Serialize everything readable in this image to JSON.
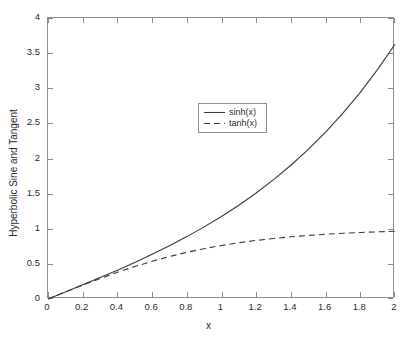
{
  "chart_data": {
    "type": "line",
    "title": "",
    "xlabel": "x",
    "ylabel": "Hyperbolic Sine and Tangent",
    "xlim": [
      0,
      2
    ],
    "ylim": [
      0,
      4
    ],
    "grid": false,
    "legend_position": "upper-left-inside",
    "xticks": [
      "0",
      "0.2",
      "0.4",
      "0.6",
      "0.8",
      "1",
      "1.2",
      "1.4",
      "1.6",
      "1.8",
      "2"
    ],
    "xtick_values": [
      0,
      0.2,
      0.4,
      0.6,
      0.8,
      1,
      1.2,
      1.4,
      1.6,
      1.8,
      2
    ],
    "yticks": [
      "0",
      "0.5",
      "1",
      "1.5",
      "2",
      "2.5",
      "3",
      "3.5",
      "4"
    ],
    "ytick_values": [
      0,
      0.5,
      1,
      1.5,
      2,
      2.5,
      3,
      3.5,
      4
    ],
    "x": [
      0,
      0.1,
      0.2,
      0.3,
      0.4,
      0.5,
      0.6,
      0.7,
      0.8,
      0.9,
      1.0,
      1.1,
      1.2,
      1.3,
      1.4,
      1.5,
      1.6,
      1.7,
      1.8,
      1.9,
      2.0
    ],
    "series": [
      {
        "name": "sinh(x)",
        "style": "solid",
        "color": "#3a3a3a",
        "values": [
          0,
          0.1002,
          0.2013,
          0.3045,
          0.4108,
          0.5211,
          0.6367,
          0.7586,
          0.8881,
          1.0265,
          1.1752,
          1.3356,
          1.5095,
          1.6984,
          1.9043,
          2.1293,
          2.3756,
          2.6456,
          2.9422,
          3.2682,
          3.6269
        ]
      },
      {
        "name": "tanh(x)",
        "style": "dashed",
        "color": "#3a3a3a",
        "values": [
          0,
          0.0997,
          0.1974,
          0.2913,
          0.3799,
          0.4621,
          0.537,
          0.6044,
          0.664,
          0.7163,
          0.7616,
          0.8005,
          0.8337,
          0.8617,
          0.8854,
          0.9051,
          0.9217,
          0.9354,
          0.9468,
          0.9562,
          0.964
        ]
      }
    ]
  },
  "legend": {
    "entries": [
      {
        "label": "sinh(x)"
      },
      {
        "label": "tanh(x)"
      }
    ]
  },
  "axes": {
    "x_title": "x",
    "y_title": "Hyperbolic Sine and Tangent"
  },
  "colors": {
    "axis": "#8d8d8d",
    "curve": "#3a3a3a",
    "text": "#2b2b2b",
    "background": "#ffffff"
  }
}
